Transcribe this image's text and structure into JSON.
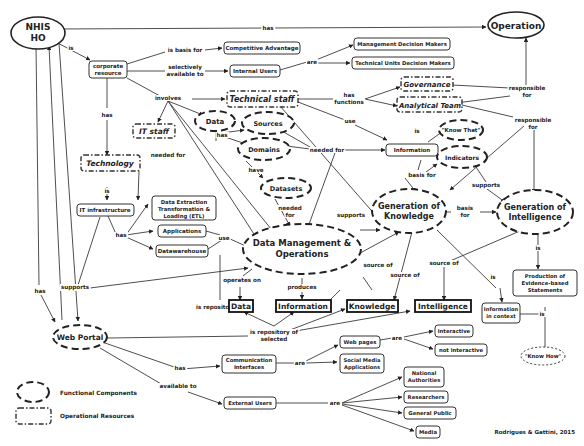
{
  "credit": "Rodrigues & Gattini, 2015",
  "legend": {
    "functional": "Functional Components",
    "operational": "Operational Resources"
  },
  "nodes": {
    "nhis_ho_1": "NHIS",
    "nhis_ho_2": "HO",
    "operation": "Operation",
    "corporate_1": "corporate",
    "corporate_2": "resource",
    "competitive": "Competitive Advantage",
    "internal_users": "Internal Users",
    "mgmt_dm": "Management Decision Makers",
    "tech_dm": "Technical Units Decision Makers",
    "governance": "Governance",
    "analytical": "Analytical Team",
    "technical_staff": "Technical staff",
    "it_staff": "IT staff",
    "technology": "Technology",
    "data_fc": "Data",
    "sources": "Sources",
    "domains": "Domains",
    "datasets": "Datasets",
    "information_node": "Information",
    "know_that": "\"Know That\"",
    "indicators": "Indicators",
    "it_infra": "IT infrastructure",
    "etl_1": "Data Extraction",
    "etl_2": "Transformation &",
    "etl_3": "Loading (ETL)",
    "applications": "Applications",
    "datawarehouse": "Datawarehouse",
    "dmo_1": "Data Management &",
    "dmo_2": "Operations",
    "gok_1": "Generation of",
    "gok_2": "Knowledge",
    "goi_1": "Generation of",
    "goi_2": "Intelligence",
    "prod_1": "Production of",
    "prod_2": "Evidence-based",
    "prod_3": "Statements",
    "know_how": "\"Know How\"",
    "out_data": "Data",
    "out_information": "Information",
    "out_knowledge": "Knowledge",
    "out_intelligence": "Intelligence",
    "info_ctx_1": "Information",
    "info_ctx_2": "in context",
    "web_portal": "Web Portal",
    "comm_1": "Communication",
    "comm_2": "Interfaces",
    "web_pages": "Web pages",
    "social_1": "Social Media",
    "social_2": "Applications",
    "interactive": "interactive",
    "not_interactive": "not interactive",
    "external_users": "External Users",
    "national_1": "National",
    "national_2": "Authorities",
    "researchers": "Researchers",
    "general_public": "General Public",
    "media": "Media"
  },
  "links": {
    "has_top": "has",
    "is": "is",
    "is_basis_for": "is basis for",
    "sel_1": "selectively",
    "sel_2": "available to",
    "are_internal": "are",
    "has_tech": "has",
    "involves": "involves",
    "has_functions_1": "has",
    "has_functions_2": "functions",
    "responsible_1a": "responsible",
    "responsible_1b": "for",
    "responsible_2a": "responsible",
    "responsible_2b": "for",
    "use_info": "use",
    "is_knowthat": "is",
    "has_data": "has",
    "needed_for_domains": "needed for",
    "needed_for_it": "needed for",
    "have": "have",
    "needed_for_ds_1": "needed",
    "needed_for_ds_2": "for",
    "basis_for_info": "basis for",
    "supports_ind": "supports",
    "is_tech": "is",
    "has_infra": "has",
    "use_apps": "use",
    "supports_dmo": "supports",
    "basis_for_gok_1": "basis",
    "basis_for_gok_2": "for",
    "supports_infra": "supports",
    "operates_on": "operates on",
    "produces": "produces",
    "source_of_1": "source of",
    "source_of_2": "source of",
    "source_of_3": "source of",
    "is_info_ctx": "is",
    "is_goi": "is",
    "is_repository_of": "is repository of",
    "is_repo_sel_1": "is repository of",
    "is_repo_sel_2": "selected",
    "has_left": "has",
    "is_prod": "is",
    "has_comm": "has",
    "are_comm": "are",
    "are_web": "are",
    "available_to": "available to",
    "are_ext": "are"
  }
}
